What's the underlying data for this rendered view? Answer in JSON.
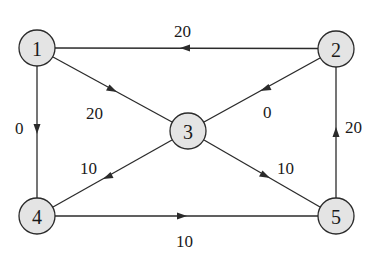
{
  "diagram": {
    "type": "directed-weighted-graph",
    "nodes": [
      {
        "id": "1",
        "label": "1",
        "x": 37,
        "y": 48
      },
      {
        "id": "2",
        "label": "2",
        "x": 336,
        "y": 49
      },
      {
        "id": "3",
        "label": "3",
        "x": 188,
        "y": 131
      },
      {
        "id": "4",
        "label": "4",
        "x": 37,
        "y": 216
      },
      {
        "id": "5",
        "label": "5",
        "x": 336,
        "y": 216
      }
    ],
    "edges": [
      {
        "from": "2",
        "to": "1",
        "weight": "20"
      },
      {
        "from": "1",
        "to": "3",
        "weight": "20"
      },
      {
        "from": "1",
        "to": "4",
        "weight": "0"
      },
      {
        "from": "2",
        "to": "3",
        "weight": "0"
      },
      {
        "from": "3",
        "to": "4",
        "weight": "10"
      },
      {
        "from": "3",
        "to": "5",
        "weight": "10"
      },
      {
        "from": "5",
        "to": "2",
        "weight": "20"
      },
      {
        "from": "4",
        "to": "5",
        "weight": "10"
      }
    ]
  }
}
